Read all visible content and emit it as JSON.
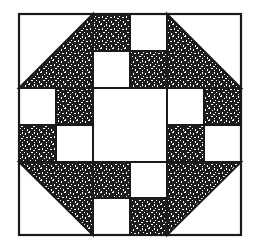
{
  "figure": {
    "colors": {
      "background": "#ffffff",
      "line": "#1a1a1a",
      "fill_dark": "#1c1c1c",
      "fill_light": "#ffffff"
    },
    "grid": {
      "units": 6,
      "origin_x": 19,
      "origin_y": 14,
      "cols": [
        19,
        56,
        93,
        130,
        167,
        204,
        241
      ],
      "rows": [
        14,
        51,
        88,
        125,
        162,
        198,
        235
      ]
    },
    "corner_triangles": [
      {
        "name": "top-left",
        "square": [
          19,
          14,
          93,
          88
        ],
        "dark_points": "19,88 93,14 93,88"
      },
      {
        "name": "top-right",
        "square": [
          167,
          14,
          241,
          88
        ],
        "dark_points": "167,14 241,88 167,88"
      },
      {
        "name": "bottom-left",
        "square": [
          19,
          162,
          93,
          235
        ],
        "dark_points": "19,162 93,162 93,235"
      },
      {
        "name": "bottom-right",
        "square": [
          167,
          162,
          241,
          235
        ],
        "dark_points": "167,162 241,162 167,235"
      }
    ],
    "squares": [
      {
        "pos": "top-r0-c2",
        "col": 2,
        "row": 0,
        "fill": "dark"
      },
      {
        "pos": "top-r0-c3",
        "col": 3,
        "row": 0,
        "fill": "light"
      },
      {
        "pos": "top-r1-c2",
        "col": 2,
        "row": 1,
        "fill": "light"
      },
      {
        "pos": "top-r1-c3",
        "col": 3,
        "row": 1,
        "fill": "dark"
      },
      {
        "pos": "left-r2-c0",
        "col": 0,
        "row": 2,
        "fill": "light"
      },
      {
        "pos": "left-r2-c1",
        "col": 1,
        "row": 2,
        "fill": "dark"
      },
      {
        "pos": "left-r3-c0",
        "col": 0,
        "row": 3,
        "fill": "dark"
      },
      {
        "pos": "left-r3-c1",
        "col": 1,
        "row": 3,
        "fill": "light"
      },
      {
        "pos": "right-r2-c4",
        "col": 4,
        "row": 2,
        "fill": "light"
      },
      {
        "pos": "right-r2-c5",
        "col": 5,
        "row": 2,
        "fill": "dark"
      },
      {
        "pos": "right-r3-c4",
        "col": 4,
        "row": 3,
        "fill": "dark"
      },
      {
        "pos": "right-r3-c5",
        "col": 5,
        "row": 3,
        "fill": "light"
      },
      {
        "pos": "bottom-r4-c2",
        "col": 2,
        "row": 4,
        "fill": "dark"
      },
      {
        "pos": "bottom-r4-c3",
        "col": 3,
        "row": 4,
        "fill": "light"
      },
      {
        "pos": "bottom-r5-c2",
        "col": 2,
        "row": 5,
        "fill": "light"
      },
      {
        "pos": "bottom-r5-c3",
        "col": 3,
        "row": 5,
        "fill": "dark"
      }
    ],
    "center": {
      "x": 93,
      "y": 88,
      "w": 74,
      "h": 74,
      "fill": "light"
    }
  }
}
